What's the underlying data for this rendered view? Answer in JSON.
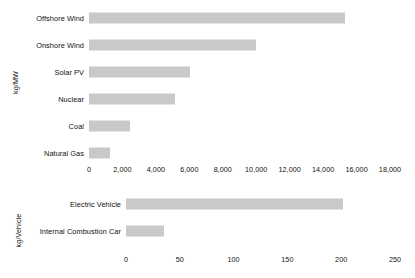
{
  "chart_data": [
    {
      "type": "bar",
      "orientation": "horizontal",
      "panel": "top",
      "title": "",
      "xlabel": "",
      "ylabel": "kg/MW",
      "categories": [
        "Offshore Wind",
        "Onshore Wind",
        "Solar PV",
        "Nuclear",
        "Coal",
        "Natural Gas"
      ],
      "values": [
        15300,
        10000,
        6050,
        5150,
        2450,
        1250
      ],
      "xlim": [
        0,
        18000
      ],
      "xticks": [
        0,
        2000,
        4000,
        6000,
        8000,
        10000,
        12000,
        14000,
        16000,
        18000
      ],
      "xticklabels": [
        "0",
        "2,000",
        "4,000",
        "6,000",
        "8,000",
        "10,000",
        "12,000",
        "14,000",
        "16,000",
        "18,000"
      ],
      "grid": false,
      "legend": "none",
      "bar_color": "#c9c9c9"
    },
    {
      "type": "bar",
      "orientation": "horizontal",
      "panel": "bottom",
      "title": "",
      "xlabel": "",
      "ylabel": "kg/Vehicle",
      "categories": [
        "Electric Vehicle",
        "Internal Combustion Car"
      ],
      "values": [
        202,
        35
      ],
      "xlim": [
        0,
        250
      ],
      "xticks": [
        0,
        50,
        100,
        150,
        200,
        250
      ],
      "xticklabels": [
        "0",
        "50",
        "100",
        "150",
        "200",
        "250"
      ],
      "grid": false,
      "legend": "none",
      "bar_color": "#c9c9c9"
    }
  ],
  "top_panel": {
    "ylabel": "kg/MW",
    "rows": [
      {
        "label": "Offshore Wind",
        "value": 15300
      },
      {
        "label": "Onshore Wind",
        "value": 10000
      },
      {
        "label": "Solar PV",
        "value": 6050
      },
      {
        "label": "Nuclear",
        "value": 5150
      },
      {
        "label": "Coal",
        "value": 2450
      },
      {
        "label": "Natural Gas",
        "value": 1250
      }
    ],
    "ticks": [
      {
        "label": "0",
        "value": 0
      },
      {
        "label": "2,000",
        "value": 2000
      },
      {
        "label": "4,000",
        "value": 4000
      },
      {
        "label": "6,000",
        "value": 6000
      },
      {
        "label": "8,000",
        "value": 8000
      },
      {
        "label": "10,000",
        "value": 10000
      },
      {
        "label": "12,000",
        "value": 12000
      },
      {
        "label": "14,000",
        "value": 14000
      },
      {
        "label": "16,000",
        "value": 16000
      },
      {
        "label": "18,000",
        "value": 18000
      }
    ],
    "axis": {
      "min": 0,
      "max": 18000,
      "x0_px": 89,
      "x1_px": 390
    },
    "label_col_width_px": 84
  },
  "bottom_panel": {
    "ylabel": "kg/Vehicle",
    "rows": [
      {
        "label": "Electric Vehicle",
        "value": 202
      },
      {
        "label": "Internal Combustion Car",
        "value": 35
      }
    ],
    "ticks": [
      {
        "label": "0",
        "value": 0
      },
      {
        "label": "50",
        "value": 50
      },
      {
        "label": "100",
        "value": 100
      },
      {
        "label": "150",
        "value": 150
      },
      {
        "label": "200",
        "value": 200
      },
      {
        "label": "250",
        "value": 250
      }
    ],
    "axis": {
      "min": 0,
      "max": 250,
      "x0_px": 126,
      "x1_px": 395
    },
    "label_col_width_px": 121
  },
  "style": {
    "bar_color": "#c9c9c9",
    "text_color": "#111111",
    "background": "#ffffff"
  }
}
